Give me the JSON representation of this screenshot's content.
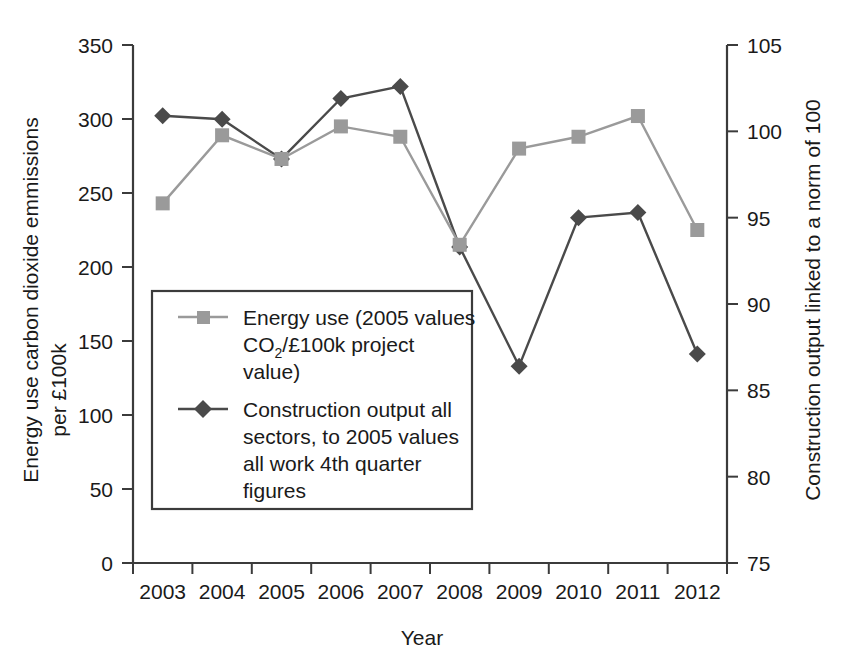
{
  "chart_data": {
    "type": "line",
    "title": "",
    "xlabel": "Year",
    "ylabel": "Energy use carbon dioxide emmissions per £100k",
    "y2label": "Construction output linked to a norm of 100",
    "grid": false,
    "legend_position": "center-left-inside",
    "categories": [
      "2003",
      "2004",
      "2005",
      "2006",
      "2007",
      "2008",
      "2009",
      "2010",
      "2011",
      "2012"
    ],
    "ylim": [
      0,
      350
    ],
    "yticks": [
      0,
      50,
      100,
      150,
      200,
      250,
      300,
      350
    ],
    "y2lim": [
      75,
      105
    ],
    "y2ticks": [
      75,
      80,
      85,
      90,
      95,
      100,
      105
    ],
    "series": [
      {
        "name": "Energy use (2005 values CO2/£100k project value)",
        "axis": "left",
        "marker": "square",
        "color": "#9a9a9a",
        "values": [
          243,
          289,
          273,
          295,
          288,
          215,
          280,
          288,
          302,
          225
        ]
      },
      {
        "name": "Construction output all sectors, to 2005 values all work 4th quarter figures",
        "axis": "right",
        "marker": "diamond",
        "color": "#4a4a4a",
        "values": [
          100.9,
          100.7,
          98.4,
          101.9,
          102.6,
          93.3,
          86.4,
          95.0,
          95.3,
          87.1
        ]
      }
    ]
  },
  "axis": {
    "x_title": "Year",
    "y_left_title_line1": "Energy use carbon dioxide emmissions",
    "y_left_title_line2": "per £100k",
    "y_right_title": "Construction output linked to a norm of 100",
    "y_left_ticks": [
      "350",
      "300",
      "250",
      "200",
      "150",
      "100",
      "50",
      "0"
    ],
    "y_right_ticks": [
      "105",
      "100",
      "95",
      "90",
      "85",
      "80",
      "75"
    ],
    "x_ticks": [
      "2003",
      "2004",
      "2005",
      "2006",
      "2007",
      "2008",
      "2009",
      "2010",
      "2011",
      "2012"
    ]
  },
  "legend": {
    "entries": [
      {
        "marker": "square-marker",
        "color": "#9a9a9a",
        "lines": [
          "Energy use (2005 values",
          "CO2/£100k project",
          "value)"
        ],
        "line2_pre": "CO",
        "line2_sub": "2",
        "line2_post": "/£100k project"
      },
      {
        "marker": "diamond-marker",
        "color": "#4a4a4a",
        "lines": [
          "Construction output all",
          "sectors, to 2005 values",
          "all work 4th quarter",
          "figures"
        ]
      }
    ]
  },
  "colors": {
    "series_energy": "#9a9a9a",
    "series_construction": "#4a4a4a",
    "axis": "#3b3b3b",
    "text": "#1a1a1a",
    "background": "#ffffff"
  }
}
